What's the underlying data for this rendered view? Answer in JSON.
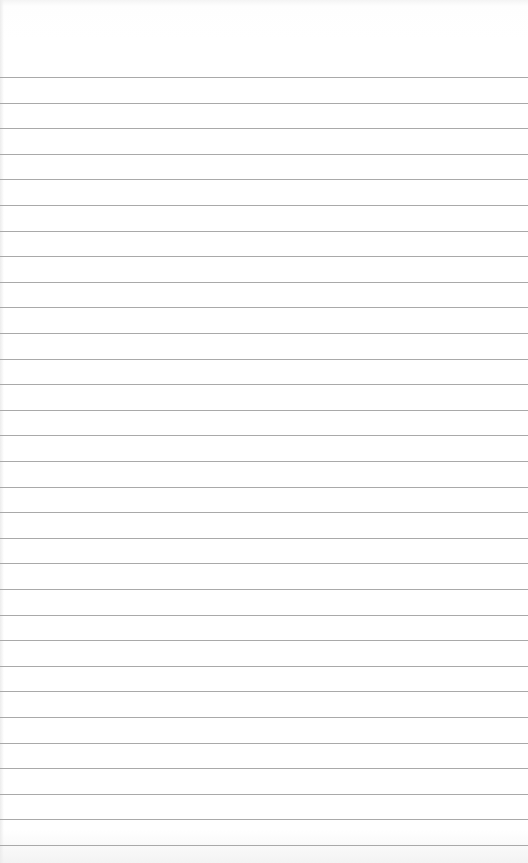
{
  "page": {
    "type": "lined-paper",
    "background_color": "#ffffff",
    "rule_color": "#a9a9a9",
    "rule_count": 31,
    "first_rule_y": 77,
    "rule_spacing": 25.6
  }
}
